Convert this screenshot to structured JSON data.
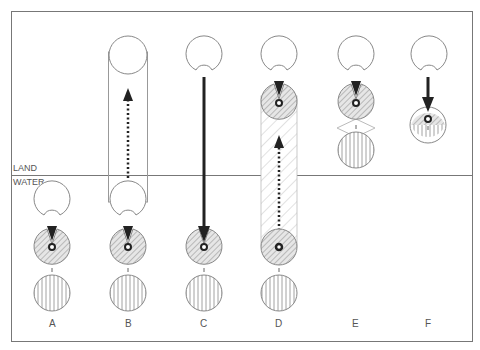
{
  "diagram": {
    "zones": {
      "land_label": "LAND",
      "water_label": "WATER"
    },
    "columns": [
      {
        "id": "A",
        "label": "A",
        "zone": "water",
        "transfer": "none",
        "has_tube": false
      },
      {
        "id": "B",
        "label": "B",
        "zone": "water",
        "transfer": "dotted-up",
        "has_tube": true,
        "tube_style": "outline"
      },
      {
        "id": "C",
        "label": "C",
        "zone": "water",
        "transfer": "solid-down",
        "has_tube": false
      },
      {
        "id": "D",
        "label": "D",
        "zone": "water",
        "transfer": "dotted-up",
        "has_tube": true,
        "tube_style": "hatched"
      },
      {
        "id": "E",
        "label": "E",
        "zone": "land",
        "transfer": "none",
        "has_tube": false,
        "has_lens_outline": true
      },
      {
        "id": "F",
        "label": "F",
        "zone": "land",
        "transfer": "solid-down",
        "has_tube": false,
        "merged_circle": true
      }
    ],
    "legend_elements": {
      "open_circle": "open circle with notch",
      "hatched_circle": "diagonal-hatched circle with nucleus",
      "striped_circle": "vertical-striped circle"
    },
    "colors": {
      "line": "#888888",
      "arrow": "#222222",
      "hatch": "#999999",
      "frame": "#777777"
    }
  }
}
